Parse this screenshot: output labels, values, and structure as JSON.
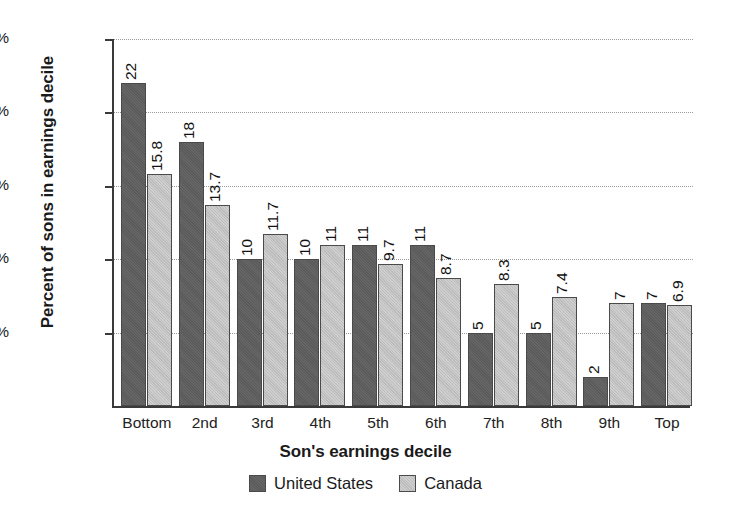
{
  "chart_data": {
    "type": "bar",
    "title": "",
    "xlabel": "Son's earnings decile",
    "ylabel": "Percent of sons in earnings decile",
    "categories": [
      "Bottom",
      "2nd",
      "3rd",
      "4th",
      "5th",
      "6th",
      "7th",
      "8th",
      "9th",
      "Top"
    ],
    "series": [
      {
        "name": "United States",
        "color": "#5e5e5e",
        "values": [
          22,
          18,
          10,
          10,
          11,
          11,
          5,
          5,
          2,
          7
        ],
        "labels": [
          "22",
          "18",
          "10",
          "10",
          "11",
          "11",
          "5",
          "5",
          "2",
          "7"
        ]
      },
      {
        "name": "Canada",
        "color": "#c2c2c2",
        "values": [
          15.8,
          13.7,
          11.7,
          11,
          9.7,
          8.7,
          8.3,
          7.4,
          7,
          6.9
        ],
        "labels": [
          "15.8",
          "13.7",
          "11.7",
          "11",
          "9.7",
          "8.7",
          "8.3",
          "7.4",
          "7",
          "6.9"
        ]
      }
    ],
    "ylim": [
      0,
      25
    ],
    "yticks": [
      5,
      10,
      15,
      20,
      25
    ],
    "ytick_labels": [
      "5%",
      "10%",
      "15%",
      "20%",
      "25%"
    ],
    "grid": "horizontal-dotted",
    "legend_position": "bottom-center"
  },
  "axes": {
    "y_title": "Percent of sons in earnings decile",
    "x_title": "Son's earnings decile"
  },
  "legend": {
    "items": [
      {
        "label": "United States",
        "swatch": "dark-gray-swatch"
      },
      {
        "label": "Canada",
        "swatch": "light-gray-swatch"
      }
    ]
  }
}
